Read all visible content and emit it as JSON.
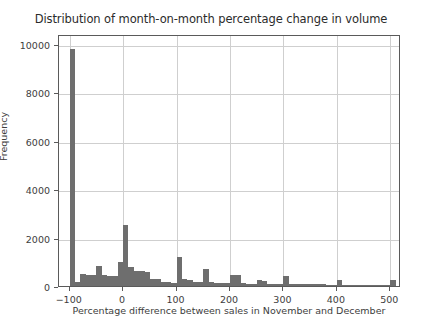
{
  "chart_data": {
    "type": "bar",
    "title": "Distribution of month-on-month percentage change in volume",
    "xlabel": "Percentage difference between sales in November and December",
    "ylabel": "Frequency",
    "xlim": [
      -120,
      520
    ],
    "ylim": [
      0,
      10400
    ],
    "grid": true,
    "legend": null,
    "bar_color": "#6e6e6e",
    "xticks": [
      -100,
      0,
      100,
      200,
      300,
      400,
      500
    ],
    "xtick_labels": [
      "−100",
      "0",
      "100",
      "200",
      "300",
      "400",
      "500"
    ],
    "yticks": [
      0,
      2000,
      4000,
      6000,
      8000,
      10000
    ],
    "ytick_labels": [
      "0",
      "2000",
      "4000",
      "6000",
      "8000",
      "10000"
    ],
    "bin_width": 10,
    "bins": [
      {
        "x": -100,
        "value": 9800
      },
      {
        "x": -90,
        "value": 150
      },
      {
        "x": -80,
        "value": 480
      },
      {
        "x": -70,
        "value": 470
      },
      {
        "x": -60,
        "value": 450
      },
      {
        "x": -50,
        "value": 820
      },
      {
        "x": -40,
        "value": 460
      },
      {
        "x": -30,
        "value": 420
      },
      {
        "x": -20,
        "value": 430
      },
      {
        "x": -10,
        "value": 1000
      },
      {
        "x": 0,
        "value": 2500
      },
      {
        "x": 10,
        "value": 770
      },
      {
        "x": 20,
        "value": 640
      },
      {
        "x": 30,
        "value": 600
      },
      {
        "x": 40,
        "value": 560
      },
      {
        "x": 50,
        "value": 310
      },
      {
        "x": 60,
        "value": 300
      },
      {
        "x": 70,
        "value": 170
      },
      {
        "x": 80,
        "value": 160
      },
      {
        "x": 90,
        "value": 140
      },
      {
        "x": 100,
        "value": 1200
      },
      {
        "x": 110,
        "value": 300
      },
      {
        "x": 120,
        "value": 260
      },
      {
        "x": 130,
        "value": 180
      },
      {
        "x": 140,
        "value": 160
      },
      {
        "x": 150,
        "value": 700
      },
      {
        "x": 160,
        "value": 150
      },
      {
        "x": 170,
        "value": 140
      },
      {
        "x": 180,
        "value": 130
      },
      {
        "x": 190,
        "value": 120
      },
      {
        "x": 200,
        "value": 460
      },
      {
        "x": 210,
        "value": 450
      },
      {
        "x": 220,
        "value": 110
      },
      {
        "x": 230,
        "value": 100
      },
      {
        "x": 240,
        "value": 95
      },
      {
        "x": 250,
        "value": 230
      },
      {
        "x": 260,
        "value": 220
      },
      {
        "x": 270,
        "value": 90
      },
      {
        "x": 280,
        "value": 85
      },
      {
        "x": 290,
        "value": 80
      },
      {
        "x": 300,
        "value": 430
      },
      {
        "x": 310,
        "value": 80
      },
      {
        "x": 320,
        "value": 75
      },
      {
        "x": 330,
        "value": 70
      },
      {
        "x": 340,
        "value": 70
      },
      {
        "x": 350,
        "value": 70
      },
      {
        "x": 360,
        "value": 65
      },
      {
        "x": 370,
        "value": 65
      },
      {
        "x": 380,
        "value": 60
      },
      {
        "x": 390,
        "value": 60
      },
      {
        "x": 400,
        "value": 250
      },
      {
        "x": 410,
        "value": 55
      },
      {
        "x": 420,
        "value": 50
      },
      {
        "x": 430,
        "value": 50
      },
      {
        "x": 440,
        "value": 45
      },
      {
        "x": 450,
        "value": 45
      },
      {
        "x": 460,
        "value": 40
      },
      {
        "x": 470,
        "value": 40
      },
      {
        "x": 480,
        "value": 40
      },
      {
        "x": 490,
        "value": 35
      },
      {
        "x": 500,
        "value": 230
      }
    ]
  }
}
